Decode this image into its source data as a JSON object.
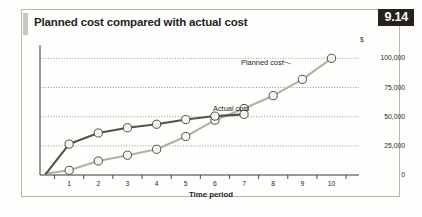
{
  "figure": {
    "number": "9.14",
    "title": "Planned cost compared with actual cost"
  },
  "axes": {
    "y_unit": "$",
    "y_ticks": [
      "100,000",
      "75,000",
      "50,000",
      "25,000",
      "0"
    ],
    "x_title": "Time period",
    "x_ticks": [
      "1",
      "2",
      "3",
      "4",
      "5",
      "6",
      "7",
      "8",
      "9",
      "10"
    ]
  },
  "annotations": {
    "planned": "Planned cost",
    "actual": "Actual cost"
  },
  "colors": {
    "planned_line": "#b3b0a4",
    "actual_line": "#55524a",
    "gridline": "#8d8a80",
    "axis": "#3a3630",
    "badge_bg": "#272219",
    "frame": "#b9b7ae"
  },
  "chart_data": {
    "type": "line",
    "title": "Planned cost compared with actual cost",
    "xlabel": "Time period",
    "ylabel": "$",
    "xlim": [
      0,
      10.6
    ],
    "ylim": [
      0,
      108000
    ],
    "grid": true,
    "grid_style": "dotted-horizontal",
    "legend": "inline-annotations",
    "x": [
      1,
      2,
      3,
      4,
      5,
      6,
      7,
      8,
      9,
      10
    ],
    "series": [
      {
        "name": "Planned cost",
        "color": "#b3b0a4",
        "marker": "open-circle",
        "origin": {
          "x": 0.18,
          "y": 1000
        },
        "values": [
          4000,
          12000,
          17000,
          22000,
          33000,
          47000,
          57000,
          68000,
          82000,
          100000
        ]
      },
      {
        "name": "Actual cost",
        "color": "#55524a",
        "marker": "open-circle",
        "origin": {
          "x": 0.2,
          "y": 1000
        },
        "values": [
          26500,
          36000,
          40500,
          43500,
          47500,
          50500,
          52000,
          null,
          null,
          null
        ]
      }
    ]
  }
}
